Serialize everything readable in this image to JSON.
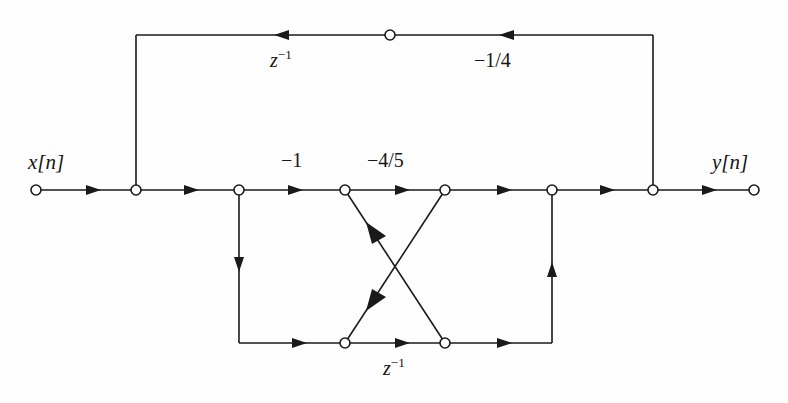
{
  "figure": {
    "type": "signal-flow-graph",
    "title": "",
    "stroke_color": "#1a1a1a",
    "background_color": "#fefefe",
    "node_fill": "#ffffff"
  },
  "labels": {
    "input_signal": "x[n]",
    "output_signal": "y[n]",
    "top_delay": "z",
    "top_delay_exp": "−1",
    "top_gain": "−1/4",
    "branch_gain_1": "−1",
    "branch_gain_2": "−4/5",
    "bottom_delay": "z",
    "bottom_delay_exp": "−1"
  },
  "nodes": [
    {
      "id": "n-in",
      "name": "input-node",
      "x": 36,
      "y": 190
    },
    {
      "id": "n-top-tap",
      "name": "top-feedback-tap-node",
      "x": 136,
      "y": 190
    },
    {
      "id": "n-split-l",
      "name": "left-branch-split-node",
      "x": 239,
      "y": 190
    },
    {
      "id": "n-cross-tl",
      "name": "cross-top-left-node",
      "x": 345,
      "y": 190
    },
    {
      "id": "n-cross-tr",
      "name": "cross-top-right-node",
      "x": 445,
      "y": 190
    },
    {
      "id": "n-join-r",
      "name": "right-branch-join-node",
      "x": 552,
      "y": 190
    },
    {
      "id": "n-top-ret",
      "name": "top-feedback-return-node",
      "x": 653,
      "y": 190
    },
    {
      "id": "n-out",
      "name": "output-node",
      "x": 754,
      "y": 190
    },
    {
      "id": "n-top-mid",
      "name": "top-delay-node",
      "x": 390,
      "y": 35
    },
    {
      "id": "n-cross-bl",
      "name": "cross-bottom-left-node",
      "x": 345,
      "y": 343
    },
    {
      "id": "n-cross-br",
      "name": "cross-bottom-right-node",
      "x": 445,
      "y": 343
    }
  ],
  "label_positions": {
    "input_signal": {
      "x": 28,
      "y": 152
    },
    "output_signal": {
      "x": 712,
      "y": 152
    },
    "top_delay": {
      "x": 270,
      "y": 50
    },
    "top_gain": {
      "x": 474,
      "y": 50
    },
    "branch_gain_1": {
      "x": 281,
      "y": 150
    },
    "branch_gain_2": {
      "x": 367,
      "y": 150
    },
    "bottom_delay": {
      "x": 383,
      "y": 358
    }
  },
  "geometry": {
    "main_line_y": 190,
    "top_line_y": 35,
    "bottom_line_y": 343,
    "node_radius": 5,
    "stroke_width": 1.6
  },
  "edges": [
    {
      "name": "edge-input-to-tap",
      "from": "n-in",
      "to": "n-top-tap",
      "direction": "right"
    },
    {
      "name": "edge-tap-to-split",
      "from": "n-top-tap",
      "to": "n-split-l",
      "direction": "right"
    },
    {
      "name": "edge-split-to-crosstl",
      "from": "n-split-l",
      "to": "n-cross-tl",
      "direction": "right",
      "gain": "−1"
    },
    {
      "name": "edge-crosstl-to-crosstr",
      "from": "n-cross-tl",
      "to": "n-cross-tr",
      "direction": "right",
      "gain": "−4/5"
    },
    {
      "name": "edge-crosstr-to-join",
      "from": "n-cross-tr",
      "to": "n-join-r",
      "direction": "right"
    },
    {
      "name": "edge-join-to-return",
      "from": "n-join-r",
      "to": "n-top-ret",
      "direction": "right"
    },
    {
      "name": "edge-return-to-output",
      "from": "n-top-ret",
      "to": "n-out",
      "direction": "right"
    },
    {
      "name": "edge-feedback-up-right",
      "from": "n-top-ret",
      "to": "n-top-mid",
      "direction": "up-left",
      "gain": "−1/4"
    },
    {
      "name": "edge-feedback-left-top",
      "from": "n-top-mid",
      "to": "n-top-tap",
      "direction": "left",
      "gain": "z^-1"
    },
    {
      "name": "edge-split-down",
      "from": "n-split-l",
      "to": "n-cross-bl",
      "direction": "down"
    },
    {
      "name": "edge-bottom-left-to-crossbl",
      "from": "n-split-l",
      "to": "n-cross-bl",
      "direction": "right"
    },
    {
      "name": "edge-crossbl-to-crossbr",
      "from": "n-cross-bl",
      "to": "n-cross-br",
      "direction": "right",
      "gain": "z^-1"
    },
    {
      "name": "edge-crossbr-to-right",
      "from": "n-cross-br",
      "to": "n-join-r",
      "direction": "right"
    },
    {
      "name": "edge-right-up",
      "from": "n-cross-br",
      "to": "n-join-r",
      "direction": "up"
    },
    {
      "name": "edge-diag-br-to-tl",
      "from": "n-cross-br",
      "to": "n-cross-tl",
      "direction": "up-left"
    },
    {
      "name": "edge-diag-tr-to-bl",
      "from": "n-cross-tr",
      "to": "n-cross-bl",
      "direction": "down-left"
    }
  ]
}
